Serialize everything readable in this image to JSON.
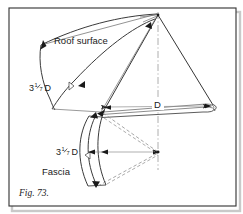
{
  "figure": {
    "caption": "Fig. 73.",
    "labels": {
      "roof_surface": "Roof surface",
      "fascia": "Fascia",
      "diameter": "D",
      "arc_len_whole": "3",
      "arc_len_numerator": "1",
      "arc_len_denominator": "7",
      "arc_len_unit": "D",
      "arc_len_full": "3 1/7 D"
    },
    "colors": {
      "ink": "#1a1a1a",
      "line": "#2b2b2b",
      "thin_line": "#7a7a7a",
      "dashed": "#8a8a8a",
      "centerline": "#9a9a9a",
      "border": "#3a3a3a",
      "shadow": "#c9c9c9",
      "background": "#ffffff"
    },
    "annotations": [
      {
        "name": "roof-surface-arc-label",
        "text": "3 1/7 D"
      },
      {
        "name": "fascia-arc-label",
        "text": "3 1/7 D"
      },
      {
        "name": "diameter-dimension-label",
        "text": "D"
      }
    ],
    "geometry": {
      "apex": [
        158,
        15
      ],
      "eave_left": [
        103,
        112
      ],
      "eave_right": [
        213,
        105
      ],
      "lower_center": [
        158,
        152
      ],
      "centerline_x": 158
    }
  }
}
